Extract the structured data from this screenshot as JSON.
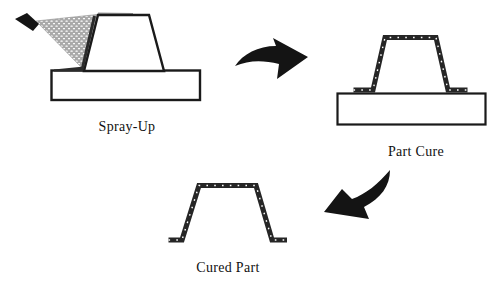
{
  "diagram": {
    "type": "process-flow",
    "stages": [
      {
        "id": "spray-up",
        "label": "Spray-Up"
      },
      {
        "id": "part-cure",
        "label": "Part Cure"
      },
      {
        "id": "cured-part",
        "label": "Cured Part"
      }
    ]
  },
  "icons": {
    "process_arrow_1": "curved-arrow-right",
    "process_arrow_2": "curved-arrow-down-left",
    "spray_gun": "spray-gun-nozzle"
  },
  "colors": {
    "line": "#1a1a1a",
    "band": "#262626",
    "layer": "#2b2b2b",
    "arrow": "#141414",
    "spray_gray": "#a9a9a9",
    "speck": "#ffffff",
    "fill": "#ffffff",
    "top_strip": "#9a9a9a",
    "text": "#111111"
  }
}
